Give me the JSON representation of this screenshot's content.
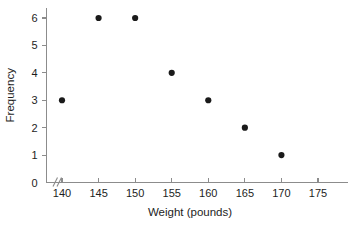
{
  "chart_data": {
    "type": "scatter",
    "title": "",
    "xlabel": "Weight (pounds)",
    "ylabel": "Frequency",
    "x": [
      140,
      145,
      150,
      155,
      160,
      165,
      170
    ],
    "values": [
      3,
      6,
      6,
      4,
      3,
      2,
      1
    ],
    "points": [
      {
        "x": 140,
        "y": 3
      },
      {
        "x": 145,
        "y": 6
      },
      {
        "x": 150,
        "y": 6
      },
      {
        "x": 155,
        "y": 4
      },
      {
        "x": 160,
        "y": 3
      },
      {
        "x": 165,
        "y": 2
      },
      {
        "x": 170,
        "y": 1
      }
    ],
    "xticks": [
      140,
      145,
      150,
      155,
      160,
      165,
      170,
      175
    ],
    "xtick_labels": [
      "140",
      "145",
      "150",
      "155",
      "160",
      "165",
      "170",
      "175"
    ],
    "yticks": [
      0,
      1,
      2,
      3,
      4,
      5,
      6
    ],
    "ytick_labels": [
      "0",
      "1",
      "2",
      "3",
      "4",
      "5",
      "6"
    ],
    "xlim": [
      136,
      178
    ],
    "ylim": [
      0,
      6.4
    ],
    "grid": false,
    "legend": null,
    "axis_break": "//",
    "marker": "filled-circle",
    "marker_color": "#1a1a1a",
    "axis_color": "#8c8c8c",
    "background_color": "#ffffff"
  }
}
